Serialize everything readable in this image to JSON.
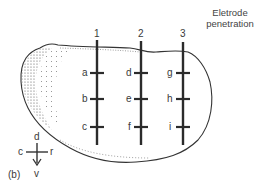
{
  "figure": {
    "panel_label": "(b)",
    "title_line1": "Eletrode",
    "title_line2": "penetration",
    "electrodes": [
      {
        "number": "1",
        "sites": [
          "a",
          "b",
          "c"
        ]
      },
      {
        "number": "2",
        "sites": [
          "d",
          "e",
          "f"
        ]
      },
      {
        "number": "3",
        "sites": [
          "g",
          "h",
          "i"
        ]
      }
    ],
    "orientation": {
      "dorsal": "d",
      "ventral": "v",
      "caudal": "c",
      "rostral": "r"
    }
  }
}
